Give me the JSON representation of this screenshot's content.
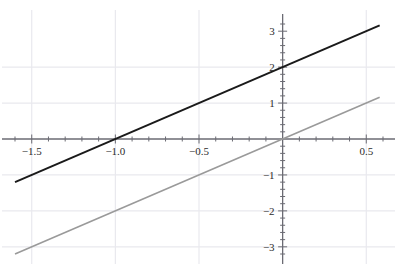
{
  "figure": {
    "top_clipped_text": "p    u    p    a  j    y"
  },
  "chart_data": {
    "type": "line",
    "title": "",
    "subtitle": "",
    "xlabel": "",
    "ylabel": "",
    "xlim": [
      -1.6,
      0.6
    ],
    "ylim": [
      -3.2,
      3.2
    ],
    "grid": true,
    "grid_color": "#e9e9ee",
    "legend": "none",
    "axis_color": "#6b6b73",
    "x_major_ticks": [
      -1.5,
      -1.0,
      -0.5,
      0.0,
      0.5
    ],
    "x_tick_labels": [
      "-1.5",
      "-1.0",
      "-0.5",
      "",
      "0.5"
    ],
    "x_minor_tick_step": 0.1,
    "y_major_ticks": [
      -3,
      -2,
      -1,
      0,
      1,
      2,
      3
    ],
    "y_tick_labels": [
      "-3",
      "-2",
      "-1",
      "",
      "1",
      "2",
      "3"
    ],
    "y_minor_tick_step": 0.2,
    "x_gridlines": [
      -1.5,
      -1.0,
      -0.5,
      0.5
    ],
    "y_gridlines": [
      -3,
      -2,
      -1,
      1,
      2
    ],
    "series": [
      {
        "name": "y = 2x + 2",
        "color": "#1a1a1a",
        "width": 2.0,
        "slope": 2,
        "intercept": 2,
        "x": [
          -1.6,
          0.58
        ],
        "y": [
          -1.2,
          3.16
        ],
        "x_intercept": -1.0,
        "y_intercept": 2.0
      },
      {
        "name": "y = 2x",
        "color": "#9a9a9a",
        "width": 1.6,
        "slope": 2,
        "intercept": 0,
        "x": [
          -1.6,
          0.58
        ],
        "y": [
          -3.2,
          1.16
        ],
        "x_intercept": 0.0,
        "y_intercept": 0.0
      }
    ]
  }
}
